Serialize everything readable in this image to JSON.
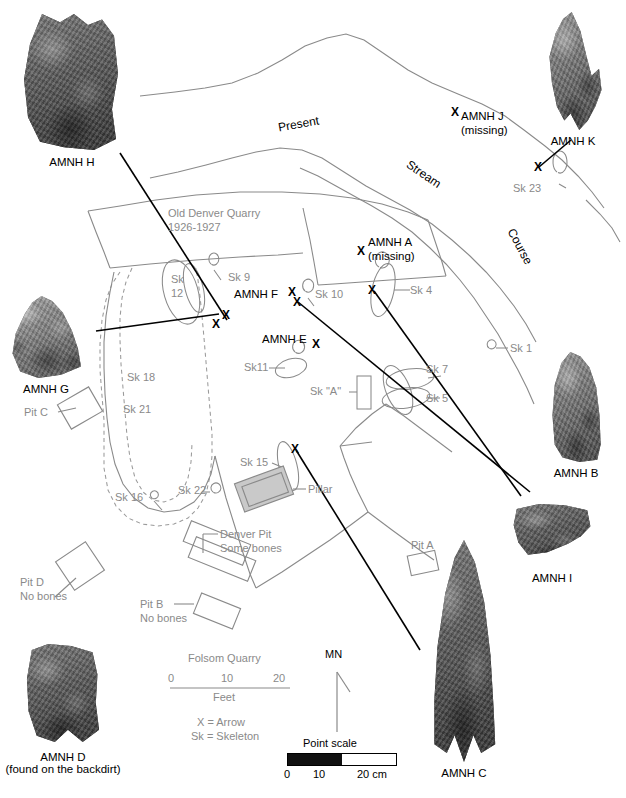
{
  "figure": {
    "site_name": "Folsom Quarry",
    "stream_label_words": [
      "Present",
      "Stream",
      "Course"
    ],
    "quarry_label": "Old Denver Quarry",
    "quarry_years": "1926-1927"
  },
  "map_labels": {
    "old_denver_quarry": "Old Denver Quarry",
    "quarry_years": "1926-1927",
    "present": "Present",
    "stream": "Stream",
    "course": "Course",
    "pillar": "Pillar",
    "denver_pit": "Denver Pit",
    "denver_pit_note": "Some bones",
    "pit_a": "Pit A",
    "pit_b": "Pit B",
    "pit_b_note": "No bones",
    "pit_c": "Pit C",
    "pit_d": "Pit D",
    "pit_d_note": "No bones",
    "sk_a": "Sk \"A\""
  },
  "skeletons": [
    {
      "id": "sk-1",
      "label": "Sk 1"
    },
    {
      "id": "sk-4",
      "label": "Sk 4"
    },
    {
      "id": "sk-5",
      "label": "Sk 5"
    },
    {
      "id": "sk-7",
      "label": "Sk 7"
    },
    {
      "id": "sk-9",
      "label": "Sk 9"
    },
    {
      "id": "sk-10",
      "label": "Sk 10"
    },
    {
      "id": "sk-11",
      "label": "Sk11"
    },
    {
      "id": "sk-12",
      "label": "Sk"
    },
    {
      "id": "sk-12b",
      "label": "12"
    },
    {
      "id": "sk-15",
      "label": "Sk 15"
    },
    {
      "id": "sk-16",
      "label": "Sk 16"
    },
    {
      "id": "sk-18",
      "label": "Sk 18"
    },
    {
      "id": "sk-21",
      "label": "Sk 21"
    },
    {
      "id": "sk-22",
      "label": "Sk 22"
    },
    {
      "id": "sk-23",
      "label": "Sk 23"
    }
  ],
  "points_on_map": [
    {
      "id": "amnh-a",
      "label": "AMNH A",
      "note": "(missing)"
    },
    {
      "id": "amnh-e",
      "label": "AMNH E",
      "note": ""
    },
    {
      "id": "amnh-f",
      "label": "AMNH F",
      "note": ""
    },
    {
      "id": "amnh-j",
      "label": "AMNH J",
      "note": "(missing)"
    }
  ],
  "specimens": [
    {
      "id": "amnh-h",
      "label": "AMNH H",
      "note": ""
    },
    {
      "id": "amnh-k",
      "label": "AMNH K",
      "note": ""
    },
    {
      "id": "amnh-g",
      "label": "AMNH G",
      "note": ""
    },
    {
      "id": "amnh-b",
      "label": "AMNH B",
      "note": ""
    },
    {
      "id": "amnh-i",
      "label": "AMNH I",
      "note": ""
    },
    {
      "id": "amnh-c",
      "label": "AMNH C",
      "note": ""
    },
    {
      "id": "amnh-d",
      "label": "AMNH D",
      "note": "(found on the backdirt)"
    }
  ],
  "legend": {
    "scale_title": "Folsom Quarry",
    "scale_ticks": [
      "0",
      "10",
      "20"
    ],
    "scale_units": "Feet",
    "key_x": "X = Arrow",
    "key_sk": "Sk = Skeleton",
    "north_label": "MN",
    "point_scale_title": "Point scale",
    "point_scale_ticks": [
      "0",
      "10",
      "20 cm"
    ]
  },
  "colors": {
    "map_line": "#8a8a8a",
    "map_text": "#8a8a8a",
    "leader_line": "#000000",
    "label_text": "#000000",
    "pillar_fill": "#c9c9c9",
    "background": "#ffffff"
  }
}
